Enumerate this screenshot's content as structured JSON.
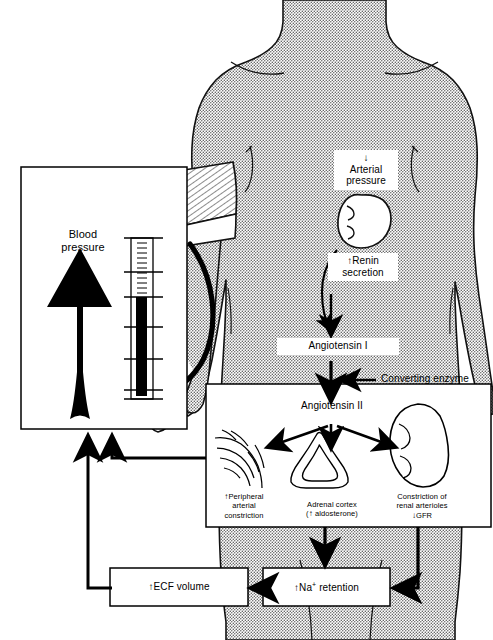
{
  "diagram": {
    "title_concept": "renin-angiotensin-aldosterone system response to decreased arterial pressure",
    "panels": {
      "blood_pressure_panel": {
        "label": "Blood\npressure",
        "label_line1": "Blood",
        "label_line2": "pressure",
        "arrow_direction": "up",
        "gauge_name": "sphygmomanometer-column"
      },
      "angiotensin2_panel": {
        "heading": "Angiotensin II",
        "effects": [
          {
            "name": "peripheral-arterial-constriction",
            "arrow": "↑",
            "line1": "Peripheral",
            "line2": "arterial",
            "line3": "constriction",
            "icon": "arteriole-branch-icon"
          },
          {
            "name": "adrenal-cortex",
            "arrow": "↑",
            "line1": "Adrenal cortex",
            "line2": "( aldosterone)",
            "line2_pre": "(",
            "line2_post": " aldosterone)",
            "icon": "adrenal-gland-icon"
          },
          {
            "name": "renal-arteriole-constriction",
            "arrow": "↓",
            "line1": "Constriction of",
            "line2": "renal arterioles",
            "line3": "GFR",
            "icon": "kidney-icon"
          }
        ]
      }
    },
    "nodes": {
      "arterial_pressure": {
        "arrow": "↓",
        "line1": "Arterial",
        "line2": "pressure"
      },
      "renin_secretion": {
        "arrow": "↑",
        "line1": "Renin",
        "line2": "secretion"
      },
      "angiotensin_1": {
        "text": "Angiotensin I"
      },
      "converting_enzyme": {
        "text": "Converting enzyme"
      },
      "ecf_volume": {
        "arrow": "↑",
        "text": "ECF volume"
      },
      "na_retention": {
        "arrow": "↑",
        "text": "Na",
        "sup": "+",
        "text2": "retention"
      }
    },
    "anatomy": {
      "body": "torso-silhouette",
      "kidney": "kidney-icon",
      "cuff": "blood-pressure-cuff-icon",
      "tubing": "cuff-tubing-icon"
    },
    "colors": {
      "ink": "#000000",
      "paper": "#ffffff",
      "body_fill": "#d8d8d8",
      "hatch": "#000000"
    }
  }
}
